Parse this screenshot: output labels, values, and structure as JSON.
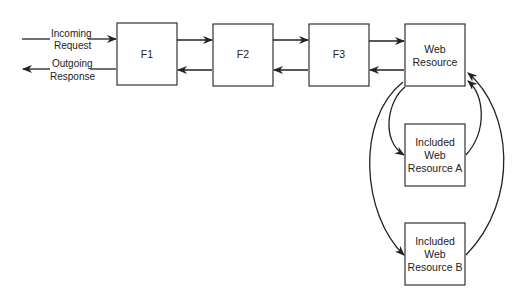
{
  "diagram": {
    "type": "filter-chain-flow",
    "nodes": {
      "f1": {
        "label": "F1"
      },
      "f2": {
        "label": "F2"
      },
      "f3": {
        "label": "F3"
      },
      "web_resource": {
        "lines": [
          "Web",
          "Resource"
        ]
      },
      "included_a": {
        "lines": [
          "Included",
          "Web",
          "Resource A"
        ]
      },
      "included_b": {
        "lines": [
          "Included",
          "Web",
          "Resource B"
        ]
      }
    },
    "edge_labels": {
      "incoming": [
        "Incoming",
        "Request"
      ],
      "outgoing": [
        "Outgoing",
        "Response"
      ]
    },
    "edges": [
      {
        "from": "client",
        "to": "f1",
        "label": "Incoming Request"
      },
      {
        "from": "f1",
        "to": "f2"
      },
      {
        "from": "f2",
        "to": "f3"
      },
      {
        "from": "f3",
        "to": "web_resource"
      },
      {
        "from": "web_resource",
        "to": "f3"
      },
      {
        "from": "f3",
        "to": "f2"
      },
      {
        "from": "f2",
        "to": "f1"
      },
      {
        "from": "f1",
        "to": "client",
        "label": "Outgoing Response"
      },
      {
        "from": "web_resource",
        "to": "included_a"
      },
      {
        "from": "included_a",
        "to": "web_resource"
      },
      {
        "from": "web_resource",
        "to": "included_b"
      },
      {
        "from": "included_b",
        "to": "web_resource"
      }
    ]
  }
}
